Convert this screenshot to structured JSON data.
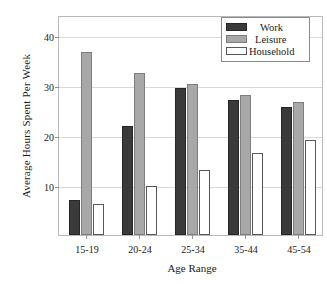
{
  "chart_data": {
    "type": "bar",
    "title": "",
    "xlabel": "Age Range",
    "ylabel": "Average Hours Spent Per Week",
    "categories": [
      "15-19",
      "20-24",
      "25-34",
      "35-44",
      "45-54"
    ],
    "series": [
      {
        "name": "Work",
        "color": "#3a3a3a",
        "values": [
          7.0,
          21.9,
          29.4,
          27.0,
          25.7
        ]
      },
      {
        "name": "Leisure",
        "color": "#a8a8a8",
        "values": [
          36.7,
          32.4,
          30.2,
          28.0,
          26.7
        ]
      },
      {
        "name": "Household",
        "color": "#ffffff",
        "values": [
          6.2,
          9.8,
          13.0,
          16.4,
          19.0
        ]
      }
    ],
    "ylim": [
      0,
      44
    ],
    "yticks": [
      10,
      20,
      30,
      40
    ],
    "ytick_labels": [
      "10",
      "20",
      "30",
      "40"
    ],
    "grid": true,
    "legend_position": "top-right"
  },
  "legend": {
    "items": [
      {
        "label": "Work"
      },
      {
        "label": "Leisure"
      },
      {
        "label": "Household"
      }
    ]
  }
}
